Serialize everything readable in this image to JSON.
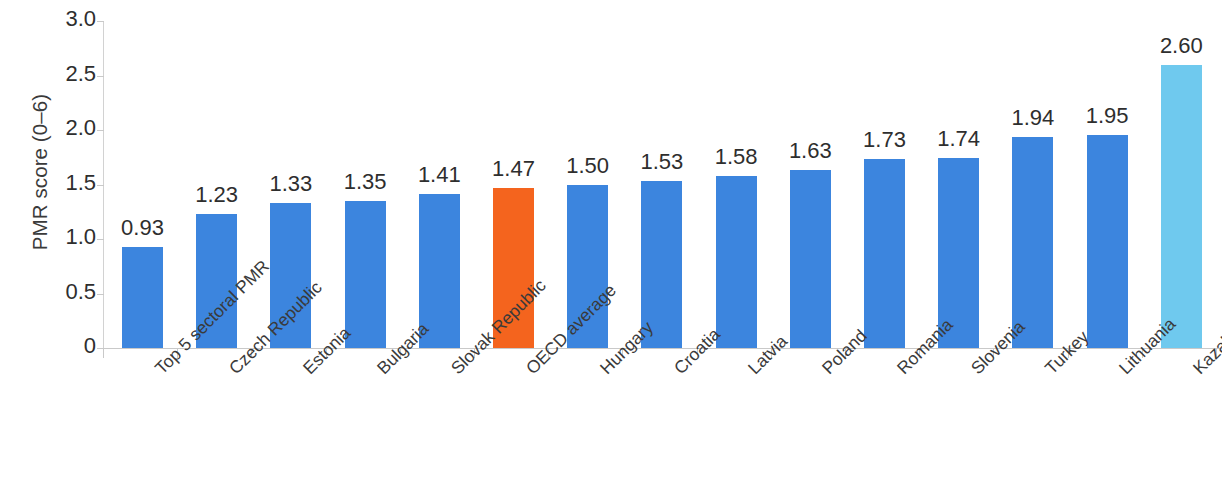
{
  "chart_data": {
    "type": "bar",
    "title": "",
    "subtitle": "",
    "xlabel": "",
    "ylabel": "PMR score (0–6)",
    "ylim": [
      0,
      3.0
    ],
    "ytick_labels": [
      "3.0",
      "2.5",
      "2.0",
      "1.5",
      "1.0",
      "0.5",
      "0"
    ],
    "ytick_values": [
      3.0,
      2.5,
      2.0,
      1.5,
      1.0,
      0.5,
      0
    ],
    "grid": false,
    "legend": null,
    "categories": [
      "Top 5 sectoral PMR",
      "Czech Republic",
      "Estonia",
      "Bulgaria",
      "Slovak Republic",
      "OECD average",
      "Hungary",
      "Croatia",
      "Latvia",
      "Poland",
      "Romania",
      "Slovenia",
      "Turkey",
      "Lithuania",
      "Kazakhstan"
    ],
    "values": [
      0.93,
      1.23,
      1.33,
      1.35,
      1.41,
      1.47,
      1.5,
      1.53,
      1.58,
      1.63,
      1.73,
      1.74,
      1.94,
      1.95,
      2.6
    ],
    "value_labels": [
      "0.93",
      "1.23",
      "1.33",
      "1.35",
      "1.41",
      "1.47",
      "1.50",
      "1.53",
      "1.58",
      "1.63",
      "1.73",
      "1.74",
      "1.94",
      "1.95",
      "2.60"
    ],
    "bar_colors": [
      "#3C85DE",
      "#3C85DE",
      "#3C85DE",
      "#3C85DE",
      "#3C85DE",
      "#F4641E",
      "#3C85DE",
      "#3C85DE",
      "#3C85DE",
      "#3C85DE",
      "#3C85DE",
      "#3C85DE",
      "#3C85DE",
      "#3C85DE",
      "#6FC9EE"
    ],
    "colors": {
      "bar_default": "#3C85DE",
      "bar_highlight_oecd": "#F4641E",
      "bar_highlight_kazakhstan": "#6FC9EE",
      "axis": "#c9c9c9",
      "text": "#2e2e2e",
      "background": "#ffffff"
    }
  }
}
